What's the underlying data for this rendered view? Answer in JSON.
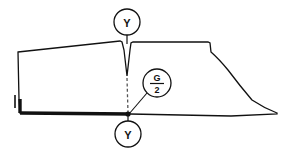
{
  "figure": {
    "type": "technical-pattern-drawing",
    "background_color": "#ffffff",
    "line_color": "#111111",
    "thin_stroke_width": 1.2,
    "bold_stroke_width": 3.2,
    "dashed_stroke": "3,2"
  },
  "callouts": {
    "top": {
      "label": "Y",
      "shape": "circle",
      "cx": 127,
      "cy": 22,
      "r": 13,
      "leader_to": {
        "x": 127,
        "y": 41
      }
    },
    "middle": {
      "label_numerator": "G",
      "label_denominator": "2",
      "label_full": "G/2",
      "shape": "circle",
      "cx": 157,
      "cy": 83,
      "r": 14,
      "leader_to": {
        "x": 130,
        "y": 114
      }
    },
    "bottom": {
      "label": "Y",
      "shape": "circle",
      "cx": 128,
      "cy": 134,
      "r": 13,
      "leader_to": {
        "x": 128,
        "y": 115
      }
    }
  },
  "geometry": {
    "outline_path": "M 18 52 L 120 41 L 122 42 L 124 50 L 127 76 L 130 50 L 131 43 L 133 42 L 208 42 L 210 43 L 211 52 Q 219 59 228 70 Q 240 86 252 100 Q 264 108 277 113 L 277 114 L 231 116 Q 180 115 130 114 L 27 113 L 20 113 L 19 99 Z",
    "dart": {
      "apex": {
        "x": 127,
        "y": 77
      },
      "left_top": {
        "x": 122,
        "y": 42
      },
      "right_top": {
        "x": 133,
        "y": 42
      }
    },
    "center_dashed_line": {
      "x1": 127,
      "y1": 77,
      "x2": 128,
      "y2": 114
    },
    "bold_bottom_edge": "M 20 113 L 130 114",
    "bold_left_edge": "M 20 99 L 20 113",
    "left_notch_step": "M 15 95 L 15 108",
    "center_marker": {
      "x": 128,
      "y": 114
    }
  },
  "labels": {
    "dart_marker": "Y",
    "girth_half": "G/2"
  }
}
